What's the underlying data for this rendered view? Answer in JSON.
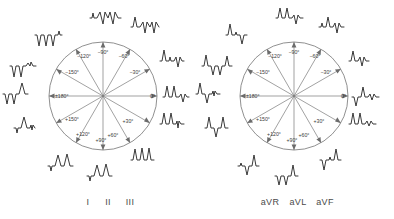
{
  "figure": {
    "background_color": "#ffffff",
    "line_color": "#6b6b6b",
    "ecg_color": "#2e2e2e",
    "label_color": "#3a3a3a"
  },
  "panels": [
    {
      "id": "limb-leads",
      "caption": "I  II  III",
      "caption_parts": [
        "I",
        "II",
        "III"
      ],
      "center": {
        "x": 103,
        "y": 96
      },
      "radius": 54,
      "angle_labels": [
        {
          "text": "0°",
          "angle": 0
        },
        {
          "text": "+30°",
          "angle": 30
        },
        {
          "text": "+60°",
          "angle": 60
        },
        {
          "text": "+90°",
          "angle": 90
        },
        {
          "text": "+120°",
          "angle": 120
        },
        {
          "text": "+150°",
          "angle": 150
        },
        {
          "text": "±180°",
          "angle": 180
        },
        {
          "text": "−150°",
          "angle": -150
        },
        {
          "text": "−120°",
          "angle": -120
        },
        {
          "text": "−90°",
          "angle": -90
        },
        {
          "text": "−60°",
          "angle": -60
        },
        {
          "text": "−30°",
          "angle": -30
        }
      ],
      "arrow_angles": [
        0,
        30,
        60,
        90,
        120,
        150,
        180,
        -150,
        -120,
        -90,
        -60,
        -30
      ],
      "complexes": [
        {
          "angle": -90,
          "pattern": "qRR-negative",
          "description": "small upward blip then two deep negative deflections"
        },
        {
          "angle": -60,
          "pattern": "rS-negative",
          "description": "one upward then two negative deflections"
        },
        {
          "angle": -30,
          "pattern": "Rs",
          "description": "tall upright, small blip, one negative"
        },
        {
          "angle": 0,
          "pattern": "RRs",
          "description": "two upright R waves then small negative"
        },
        {
          "angle": 30,
          "pattern": "RRq",
          "description": "two upright R waves with small terminal blip"
        },
        {
          "angle": 60,
          "pattern": "RRR",
          "description": "three upright R waves"
        },
        {
          "angle": 90,
          "pattern": "qRR",
          "description": "small negative blip then two tall R waves"
        },
        {
          "angle": 120,
          "pattern": "rRR",
          "description": "small negative then two upright R waves"
        },
        {
          "angle": 150,
          "pattern": "rR",
          "description": "small negative blip then upright R wave"
        },
        {
          "angle": 180,
          "pattern": "QQr",
          "description": "two negative deflections then upright"
        },
        {
          "angle": -150,
          "pattern": "QQq",
          "description": "two deep negatives with small blip"
        },
        {
          "angle": -120,
          "pattern": "QQQ",
          "description": "three negative deflections"
        }
      ]
    },
    {
      "id": "augmented-leads",
      "caption": "aVR  aVL  aVF",
      "caption_parts": [
        "aVR",
        "aVL",
        "aVF"
      ],
      "center": {
        "x": 294,
        "y": 96
      },
      "radius": 54,
      "angle_labels": [
        {
          "text": "0°",
          "angle": 0
        },
        {
          "text": "+30°",
          "angle": 30
        },
        {
          "text": "+60°",
          "angle": 60
        },
        {
          "text": "+90°",
          "angle": 90
        },
        {
          "text": "+120°",
          "angle": 120
        },
        {
          "text": "+150°",
          "angle": 150
        },
        {
          "text": "±180°",
          "angle": 180
        },
        {
          "text": "−150°",
          "angle": -150
        },
        {
          "text": "−120°",
          "angle": -120
        },
        {
          "text": "−90°",
          "angle": -90
        },
        {
          "text": "−60°",
          "angle": -60
        },
        {
          "text": "−30°",
          "angle": -30
        }
      ],
      "arrow_angles": [
        0,
        30,
        60,
        90,
        120,
        150,
        180,
        -150,
        -120,
        -90,
        -60,
        -30
      ],
      "complexes": [
        {
          "angle": -90,
          "pattern": "RRs",
          "description": "two upright R waves then negative"
        },
        {
          "angle": -60,
          "pattern": "qRs",
          "description": "small blip, upright, negative"
        },
        {
          "angle": -30,
          "pattern": "RrR",
          "description": "upright with small negative"
        },
        {
          "angle": 0,
          "pattern": "sRr",
          "description": "negative, upright, small blip"
        },
        {
          "angle": 30,
          "pattern": "RR",
          "description": "two upright R waves"
        },
        {
          "angle": 60,
          "pattern": "QqR",
          "description": "negative, small blip, upright"
        },
        {
          "angle": 90,
          "pattern": "QQR",
          "description": "two negatives then upright"
        },
        {
          "angle": 120,
          "pattern": "qQR",
          "description": "small blip, negative, upright"
        },
        {
          "angle": 150,
          "pattern": "RqR",
          "description": "upright, negative, upright"
        },
        {
          "angle": 180,
          "pattern": "Rsq",
          "description": "upright then negative and blip"
        },
        {
          "angle": -150,
          "pattern": "RQQ",
          "description": "upright then two negatives"
        },
        {
          "angle": -120,
          "pattern": "RqS",
          "description": "upright, blip, negative"
        }
      ]
    }
  ]
}
